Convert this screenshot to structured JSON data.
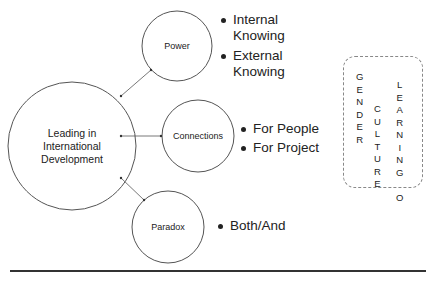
{
  "diagram": {
    "center": {
      "label": "Leading in International Development"
    },
    "nodes": [
      {
        "id": "power",
        "label": "Power",
        "bullets": [
          "Internal Knowing",
          "External Knowing"
        ]
      },
      {
        "id": "connections",
        "label": "Connections",
        "bullets": [
          "For People",
          "For Project"
        ]
      },
      {
        "id": "paradox",
        "label": "Paradox",
        "bullets": [
          "Both/And"
        ]
      }
    ],
    "lenses": {
      "words": [
        {
          "word": "GENDER",
          "letters": [
            "G",
            "E",
            "N",
            "D",
            "E",
            "R"
          ]
        },
        {
          "word": "CULTURE",
          "letters": [
            "C",
            "U",
            "L",
            "T",
            "U",
            "R",
            "E"
          ]
        },
        {
          "word": "LEARNING O",
          "letters": [
            "L",
            "E",
            "A",
            "R",
            "N",
            "I",
            "N",
            "G",
            " ",
            "O"
          ]
        }
      ]
    },
    "colors": {
      "stroke": "#555555",
      "text": "#222222",
      "dashed_border": "#888888",
      "divider": "#333333"
    }
  }
}
